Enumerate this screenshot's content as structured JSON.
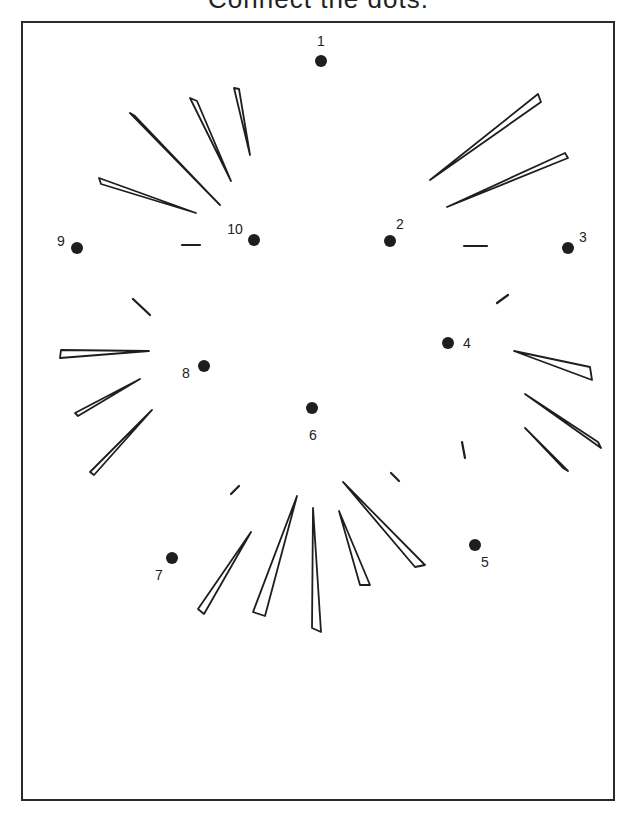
{
  "title": "Connect the dots.",
  "dots": [
    {
      "n": "1",
      "x": 321,
      "y": 61,
      "lx": 321,
      "ly": 46,
      "anchor": "middle"
    },
    {
      "n": "2",
      "x": 390,
      "y": 241,
      "lx": 400,
      "ly": 229,
      "anchor": "middle"
    },
    {
      "n": "3",
      "x": 568,
      "y": 248,
      "lx": 583,
      "ly": 242,
      "anchor": "middle"
    },
    {
      "n": "4",
      "x": 448,
      "y": 343,
      "lx": 467,
      "ly": 348,
      "anchor": "middle"
    },
    {
      "n": "5",
      "x": 475,
      "y": 545,
      "lx": 485,
      "ly": 567,
      "anchor": "middle"
    },
    {
      "n": "6",
      "x": 312,
      "y": 408,
      "lx": 313,
      "ly": 440,
      "anchor": "middle"
    },
    {
      "n": "7",
      "x": 172,
      "y": 558,
      "lx": 159,
      "ly": 580,
      "anchor": "middle"
    },
    {
      "n": "8",
      "x": 204,
      "y": 366,
      "lx": 186,
      "ly": 378,
      "anchor": "middle"
    },
    {
      "n": "9",
      "x": 77,
      "y": 248,
      "lx": 61,
      "ly": 246,
      "anchor": "middle"
    },
    {
      "n": "10",
      "x": 254,
      "y": 240,
      "lx": 235,
      "ly": 234,
      "anchor": "middle"
    }
  ],
  "colors": {
    "ink": "#1e1e1e",
    "paper": "#ffffff"
  }
}
